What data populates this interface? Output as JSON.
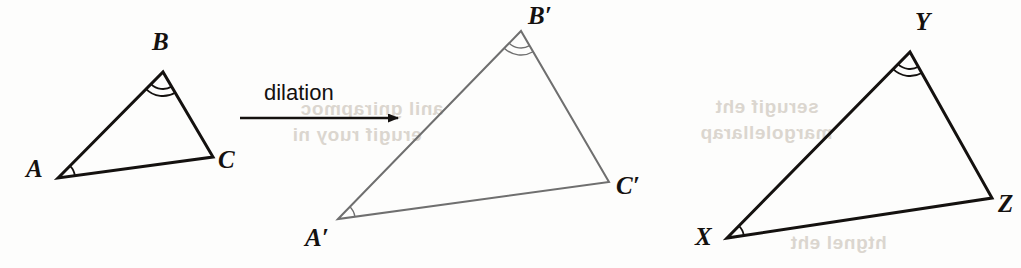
{
  "figure": {
    "kind": "geometry-diagram",
    "background_color": "#fdfdfc",
    "stroke_colors": {
      "preimage": "#14110f",
      "image": "#6f6f6f",
      "third_triangle": "#14110f",
      "arrow": "#14110f",
      "label": "#14110f"
    },
    "transformation": {
      "label": "dilation",
      "arrow": {
        "x1": 240,
        "y1": 118,
        "x2": 398,
        "y2": 118
      }
    },
    "triangles": [
      {
        "name": "triangle-abc",
        "role": "preimage",
        "stroke": "#14110f",
        "stroke_width": 3,
        "vertices": [
          {
            "id": "A",
            "label": "A",
            "x": 58,
            "y": 178,
            "label_x": 26,
            "label_y": 155,
            "arcs": 1
          },
          {
            "id": "B",
            "label": "B",
            "x": 163,
            "y": 72,
            "label_x": 152,
            "label_y": 28,
            "arcs": 2
          },
          {
            "id": "C",
            "label": "C",
            "x": 213,
            "y": 157,
            "label_x": 218,
            "label_y": 146,
            "arcs": 0
          }
        ]
      },
      {
        "name": "triangle-a-prime-b-prime-c-prime",
        "role": "image",
        "stroke": "#6f6f6f",
        "stroke_width": 2,
        "vertices": [
          {
            "id": "A'",
            "label": "A′",
            "x": 338,
            "y": 219,
            "label_x": 305,
            "label_y": 224,
            "arcs": 1
          },
          {
            "id": "B'",
            "label": "B′",
            "x": 521,
            "y": 31,
            "label_x": 528,
            "label_y": 2,
            "arcs": 2
          },
          {
            "id": "C'",
            "label": "C′",
            "x": 609,
            "y": 182,
            "label_x": 616,
            "label_y": 172,
            "arcs": 0
          }
        ]
      },
      {
        "name": "triangle-xyz",
        "role": "comparison",
        "stroke": "#14110f",
        "stroke_width": 3,
        "vertices": [
          {
            "id": "X",
            "label": "X",
            "x": 727,
            "y": 238,
            "label_x": 695,
            "label_y": 223,
            "arcs": 1
          },
          {
            "id": "Y",
            "label": "Y",
            "x": 910,
            "y": 52,
            "label_x": 915,
            "label_y": 8,
            "arcs": 2
          },
          {
            "id": "Z",
            "label": "Z",
            "x": 992,
            "y": 198,
            "label_x": 998,
            "label_y": 190,
            "arcs": 0
          }
        ]
      }
    ],
    "bleed_through": [
      {
        "text": "anil gnirapmoc",
        "x": 300,
        "y": 98
      },
      {
        "text": "erugif ruoy ni",
        "x": 292,
        "y": 124
      },
      {
        "text": "serugif eht",
        "x": 715,
        "y": 96
      },
      {
        "text": "margolellarap",
        "x": 700,
        "y": 122
      },
      {
        "text": "htgnel eht",
        "x": 790,
        "y": 232
      }
    ]
  }
}
